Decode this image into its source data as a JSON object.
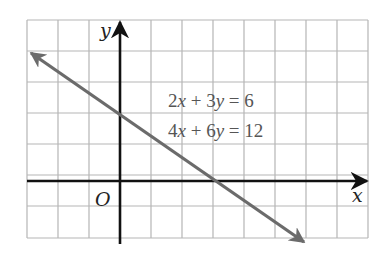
{
  "chart_data": {
    "type": "line",
    "title": "",
    "xlabel": "x",
    "ylabel": "y",
    "origin_label": "O",
    "grid": true,
    "xlim": [
      -3,
      8
    ],
    "ylim": [
      -2,
      5
    ],
    "grid_step": 1,
    "series": [
      {
        "name": "2x + 3y = 6 / 4x + 6y = 12",
        "equations": [
          "2x + 3y = 6",
          "4x + 6y = 12"
        ],
        "slope": -0.6667,
        "y_intercept": 2,
        "x_intercept": 3,
        "x": [
          -3,
          6
        ],
        "y": [
          4,
          -2
        ],
        "arrows": "both",
        "color": "#6b6b6b"
      }
    ],
    "annotations": [
      {
        "text": "2x + 3y = 6",
        "x": 1.6,
        "y": 2.5
      },
      {
        "text": "4x + 6y = 12",
        "x": 1.6,
        "y": 1.5
      }
    ]
  },
  "labels": {
    "y_axis": "y",
    "x_axis": "x",
    "origin": "O",
    "eq1_coef1": "2",
    "eq1_var1": "x",
    "eq1_op": " + ",
    "eq1_coef2": "3",
    "eq1_var2": "y",
    "eq1_rhs": " = 6",
    "eq2_coef1": "4",
    "eq2_var1": "x",
    "eq2_op": " + ",
    "eq2_coef2": "6",
    "eq2_var2": "y",
    "eq2_rhs": " = 12"
  },
  "colors": {
    "grid": "#b5b5b5",
    "axes": "#111111",
    "line": "#6b6b6b",
    "text": "#555555"
  }
}
